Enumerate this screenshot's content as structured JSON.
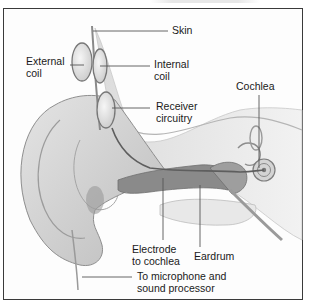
{
  "figure": {
    "labels": {
      "skin": "Skin",
      "external_coil": "External\ncoil",
      "internal_coil": "Internal\ncoil",
      "receiver_circuitry": "Receiver\ncircuitry",
      "cochlea": "Cochlea",
      "electrode": "Electrode\nto cochlea",
      "eardrum": "Eardrum",
      "microphone": "To microphone and\nsound processor"
    },
    "colors": {
      "frame": "#3a3a3a",
      "leader_line": "#555555",
      "skin_tone": "#cfcfcf",
      "tissue": "#b8b8b8",
      "canal": "#7d7d7d",
      "text": "#1a1a1a"
    }
  }
}
